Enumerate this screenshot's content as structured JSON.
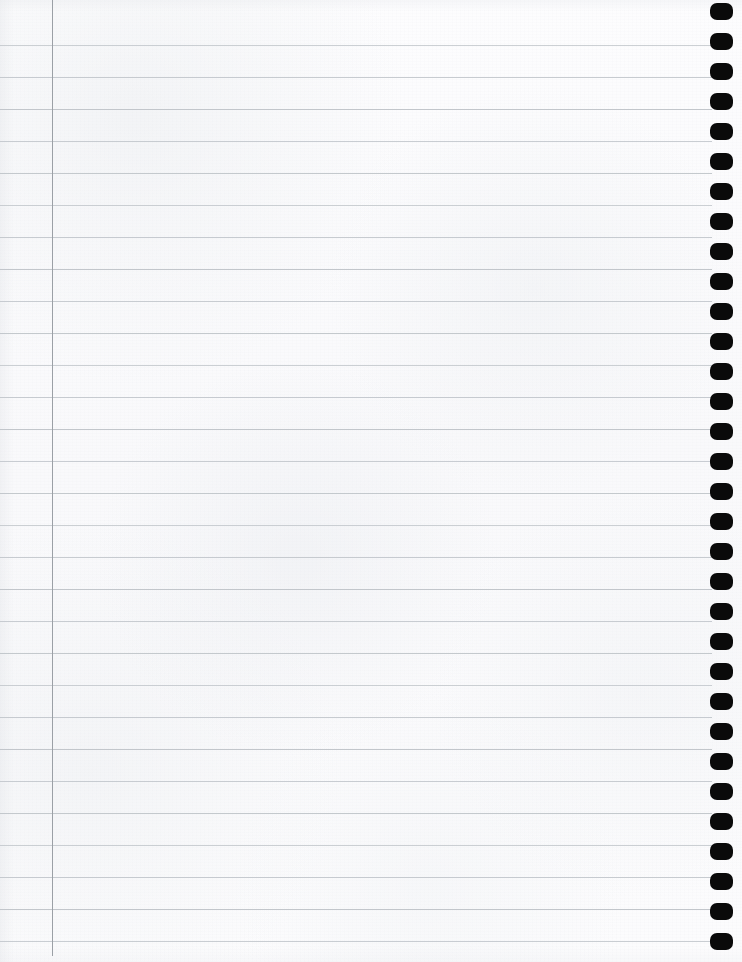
{
  "document": {
    "kind": "notebook-page",
    "title": "Blank spiral-bound ruled notebook page",
    "content_text": "",
    "page_width": 742,
    "page_height": 962,
    "paper_color": "#fbfbfc",
    "binding_side": "right"
  },
  "ruling": {
    "line_color": "#bfc4c9",
    "line_thickness": 1,
    "line_spacing": 32,
    "first_line_y": 45,
    "line_count": 29,
    "line_start_x": 0,
    "line_end_x": 712,
    "line_positions": [
      45,
      77,
      109,
      141,
      173,
      205,
      237,
      269,
      301,
      333,
      365,
      397,
      429,
      461,
      493,
      525,
      557,
      589,
      621,
      653,
      685,
      717,
      749,
      781,
      813,
      845,
      877,
      909,
      941
    ]
  },
  "margin_rule": {
    "color": "#9ba0a6",
    "x": 52,
    "thickness": 1,
    "top_y": 0,
    "bottom_y": 956
  },
  "binding_holes": {
    "color": "#0a0a0a",
    "count": 32,
    "width": 23,
    "height": 17,
    "center_x": 721,
    "first_center_y": 11,
    "spacing": 30,
    "corner_radius": 7
  }
}
